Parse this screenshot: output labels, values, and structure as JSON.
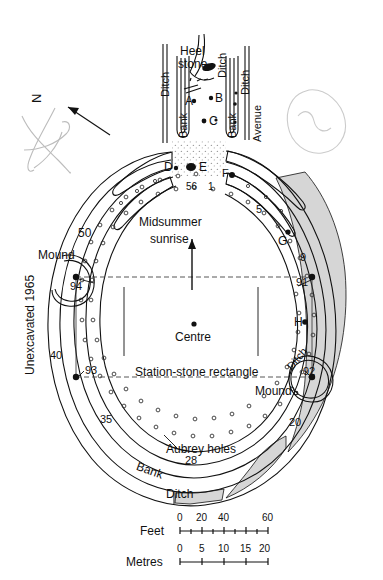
{
  "figure": {
    "type": "archaeological-site-plan",
    "orientation_label": "N"
  },
  "labels": {
    "north": "N",
    "heel_stone": "Heel\nstone",
    "heel_stone_line1": "Heel",
    "heel_stone_line2": "stone",
    "ditch_left": "Ditch",
    "ditch_mid": "Ditch",
    "ditch_right": "Ditch",
    "bank_left": "Bank",
    "bank_right": "Bank",
    "avenue": "Avenue",
    "midsummer_line1": "Midsummer",
    "midsummer_line2": "sunrise",
    "centre": "Centre",
    "station_stone_rectangle": "Station-stone rectangle",
    "aubrey_holes": "Aubrey holes",
    "bank_bottom": "Bank",
    "ditch_bottom": "Ditch",
    "ditch_right_mound": "Ditch",
    "mound_left": "Mound",
    "mound_right": "Mound",
    "unexcavated": "Unexcavated 1965"
  },
  "stone_markers": [
    {
      "id": "A",
      "label": "A"
    },
    {
      "id": "B",
      "label": "B"
    },
    {
      "id": "C",
      "label": "C"
    },
    {
      "id": "D",
      "label": "D"
    },
    {
      "id": "E",
      "label": "E"
    },
    {
      "id": "F",
      "label": "F"
    },
    {
      "id": "G",
      "label": "G"
    },
    {
      "id": "H",
      "label": "H"
    }
  ],
  "aubrey_hole_numbers": [
    "56",
    "1",
    "5",
    "9",
    "20",
    "28",
    "35",
    "40",
    "50"
  ],
  "station_stones": [
    "91",
    "92",
    "93",
    "94"
  ],
  "scales": [
    {
      "name": "Feet",
      "ticks": [
        "0",
        "20",
        "40",
        "60"
      ]
    },
    {
      "name": "Metres",
      "ticks": [
        "0",
        "5",
        "10",
        "15",
        "20"
      ]
    }
  ],
  "colors": {
    "ink": "#111111",
    "paper": "#ffffff",
    "shading": "#cfcfcf",
    "doodle": "#b9b9b9"
  }
}
